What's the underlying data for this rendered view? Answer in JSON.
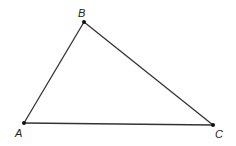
{
  "diagram": {
    "type": "triangle",
    "stroke_color": "#333333",
    "vertices": [
      {
        "id": "A",
        "label": "A",
        "x": 24,
        "y": 123,
        "label_x": 15,
        "label_y": 137
      },
      {
        "id": "B",
        "label": "B",
        "x": 84,
        "y": 22,
        "label_x": 78,
        "label_y": 17
      },
      {
        "id": "C",
        "label": "C",
        "x": 213,
        "y": 125,
        "label_x": 215,
        "label_y": 138
      }
    ],
    "edges": [
      {
        "from": "A",
        "to": "B"
      },
      {
        "from": "B",
        "to": "C"
      },
      {
        "from": "A",
        "to": "C"
      }
    ]
  }
}
